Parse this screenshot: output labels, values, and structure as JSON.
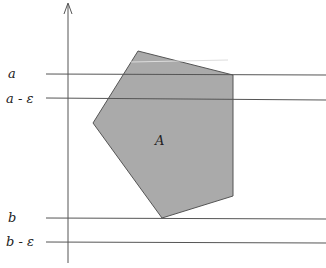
{
  "diagram": {
    "labels": {
      "a": "a",
      "a_minus_eps": "a - ε",
      "b": "b",
      "b_minus_eps": "b - ε",
      "region": "A"
    },
    "colors": {
      "region_fill": "#aaaaaa",
      "line": "#555555",
      "background": "#ffffff"
    },
    "horizontal_lines": [
      {
        "name": "a",
        "y": 74
      },
      {
        "name": "a - ε",
        "y": 99
      },
      {
        "name": "b",
        "y": 218
      },
      {
        "name": "b - ε",
        "y": 242
      }
    ],
    "polygon_vertices": [
      [
        138,
        51
      ],
      [
        233,
        75
      ],
      [
        233,
        196
      ],
      [
        162,
        218
      ],
      [
        93,
        123
      ]
    ]
  }
}
